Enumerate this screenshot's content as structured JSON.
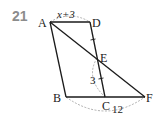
{
  "problem": {
    "number": "21"
  },
  "diagram": {
    "points": {
      "A": {
        "label": "A",
        "x": 50,
        "y": 22
      },
      "D": {
        "label": "D",
        "x": 90,
        "y": 22
      },
      "E": {
        "label": "E",
        "x": 97,
        "y": 58
      },
      "B": {
        "label": "B",
        "x": 66,
        "y": 97
      },
      "C": {
        "label": "C",
        "x": 105,
        "y": 97
      },
      "F": {
        "label": "F",
        "x": 145,
        "y": 97
      }
    },
    "measures": {
      "AD": "x+3",
      "CE": "3",
      "BF": "12"
    },
    "colors": {
      "line": "#1a1a1a",
      "dashed": "#9a9a9a",
      "number": "#8c8c8c"
    }
  }
}
